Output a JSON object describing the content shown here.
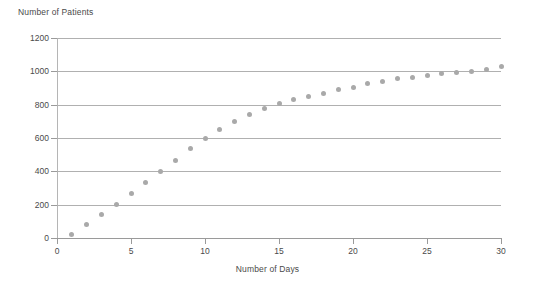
{
  "chart_data": {
    "type": "scatter",
    "title": "",
    "xlabel": "Number of Days",
    "ylabel": "Number of Patients",
    "xlim": [
      0,
      30
    ],
    "ylim": [
      0,
      1200
    ],
    "grid": true,
    "legend": false,
    "marker_color": "#a9a9a9",
    "gridline_color": "#b0b0b0",
    "axis_color": "#9a9a9a",
    "x_ticks": [
      0,
      5,
      10,
      15,
      20,
      25,
      30
    ],
    "y_ticks": [
      0,
      200,
      400,
      600,
      800,
      1000,
      1200
    ],
    "x_tick_labels": [
      "0",
      "5",
      "10",
      "15",
      "20",
      "25",
      "30"
    ],
    "y_tick_labels": [
      "0",
      "200",
      "400",
      "600",
      "800",
      "1000",
      "1200"
    ],
    "x": [
      1,
      2,
      3,
      4,
      5,
      6,
      7,
      8,
      9,
      10,
      11,
      12,
      13,
      14,
      15,
      16,
      17,
      18,
      19,
      20,
      21,
      22,
      23,
      24,
      25,
      26,
      27,
      28,
      29,
      30
    ],
    "y": [
      20,
      80,
      140,
      200,
      265,
      335,
      400,
      465,
      535,
      600,
      650,
      700,
      740,
      775,
      805,
      830,
      850,
      870,
      890,
      905,
      925,
      940,
      955,
      965,
      975,
      985,
      995,
      1000,
      1010,
      1030
    ],
    "values": [
      {
        "day": 1,
        "patients": 20
      },
      {
        "day": 2,
        "patients": 80
      },
      {
        "day": 3,
        "patients": 140
      },
      {
        "day": 4,
        "patients": 200
      },
      {
        "day": 5,
        "patients": 265
      },
      {
        "day": 6,
        "patients": 335
      },
      {
        "day": 7,
        "patients": 400
      },
      {
        "day": 8,
        "patients": 465
      },
      {
        "day": 9,
        "patients": 535
      },
      {
        "day": 10,
        "patients": 600
      },
      {
        "day": 11,
        "patients": 650
      },
      {
        "day": 12,
        "patients": 700
      },
      {
        "day": 13,
        "patients": 740
      },
      {
        "day": 14,
        "patients": 775
      },
      {
        "day": 15,
        "patients": 805
      },
      {
        "day": 16,
        "patients": 830
      },
      {
        "day": 17,
        "patients": 850
      },
      {
        "day": 18,
        "patients": 870
      },
      {
        "day": 19,
        "patients": 890
      },
      {
        "day": 20,
        "patients": 905
      },
      {
        "day": 21,
        "patients": 925
      },
      {
        "day": 22,
        "patients": 940
      },
      {
        "day": 23,
        "patients": 955
      },
      {
        "day": 24,
        "patients": 965
      },
      {
        "day": 25,
        "patients": 975
      },
      {
        "day": 26,
        "patients": 985
      },
      {
        "day": 27,
        "patients": 995
      },
      {
        "day": 28,
        "patients": 1000
      },
      {
        "day": 29,
        "patients": 1010
      },
      {
        "day": 30,
        "patients": 1030
      }
    ]
  }
}
